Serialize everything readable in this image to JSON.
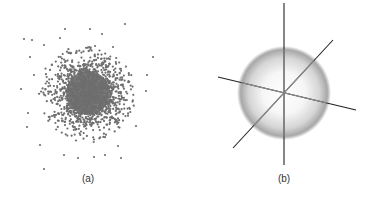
{
  "figure": {
    "panels": [
      {
        "id": "a",
        "caption": "(a)",
        "description": "2D Gaussian scatter of points, dense core fading outward",
        "scatter": {
          "center": [
            88,
            93
          ],
          "sigma": 19,
          "count": 1500,
          "point_radius": 1.1,
          "point_color": "#6e6e6e",
          "core_color": "#7a7a7a",
          "core_radius": 22,
          "outliers": [
            [
              125,
              24
            ],
            [
              24,
              39
            ],
            [
              65,
              29
            ],
            [
              90,
              29
            ],
            [
              102,
              34
            ],
            [
              153,
              57
            ],
            [
              30,
              57
            ],
            [
              146,
              91
            ],
            [
              21,
              89
            ],
            [
              136,
              126
            ],
            [
              44,
              169
            ],
            [
              27,
              127
            ],
            [
              78,
              158
            ],
            [
              121,
              158
            ],
            [
              64,
              155
            ],
            [
              94,
              157
            ],
            [
              105,
              155
            ],
            [
              40,
              145
            ],
            [
              118,
              146
            ],
            [
              60,
              38
            ],
            [
              44,
              45
            ],
            [
              113,
              47
            ],
            [
              34,
              75
            ],
            [
              147,
              75
            ],
            [
              28,
              113
            ],
            [
              32,
              40
            ]
          ]
        }
      },
      {
        "id": "b",
        "caption": "(b)",
        "description": "Shaded sphere with three intersecting coordinate axes",
        "sphere": {
          "center": [
            95,
            93
          ],
          "radius": 44,
          "highlight_color": "#ffffff",
          "edge_color": "#8a8a8a"
        },
        "axes": [
          {
            "name": "vertical",
            "from": [
              95,
              3
            ],
            "to": [
              95,
              165
            ]
          },
          {
            "name": "horizontal",
            "from": [
              29,
              77
            ],
            "to": [
              167,
              110
            ]
          },
          {
            "name": "diagonal",
            "from": [
              44,
              148
            ],
            "to": [
              144,
              40
            ]
          }
        ],
        "axis_outer_color": "#222222",
        "axis_inner_color": "#8c8c8c"
      }
    ]
  }
}
